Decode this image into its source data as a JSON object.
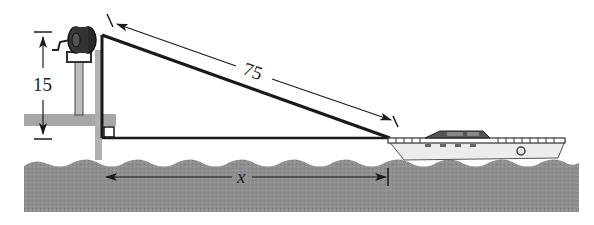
{
  "figure": {
    "labels": {
      "height": "15",
      "rope_length": "75",
      "horizontal_distance": "x"
    },
    "colors": {
      "water": "#8e8e8e",
      "dock": "#a9a9a9",
      "lines": "#1a1a1a",
      "background": "#ffffff",
      "boat_hull": "#e6e6e6"
    }
  }
}
